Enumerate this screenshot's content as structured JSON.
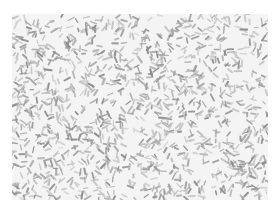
{
  "image": {
    "kind": "grayscale micrograph of densely packed rod-shaped particles",
    "colors": {
      "page_background": "#ffffff",
      "field_background": "#f4f4f4",
      "rod_dark": "#8a8a8a",
      "rod_mid": "#a8a8a8",
      "rod_light": "#c4c4c4"
    },
    "field": {
      "x": 12,
      "y": 14,
      "width": 256,
      "height": 186
    },
    "texture": {
      "rod_count": 1400,
      "rod_length_min": 3,
      "rod_length_max": 7,
      "rod_width_min": 1.2,
      "rod_width_max": 2.2,
      "seed": 7
    },
    "clear_patches": [
      {
        "cx": 232,
        "cy": 36,
        "r": 9
      },
      {
        "cx": 208,
        "cy": 128,
        "r": 8
      },
      {
        "cx": 170,
        "cy": 18,
        "r": 7
      },
      {
        "cx": 120,
        "cy": 100,
        "r": 6
      },
      {
        "cx": 200,
        "cy": 170,
        "r": 7
      },
      {
        "cx": 40,
        "cy": 150,
        "r": 6
      }
    ]
  }
}
